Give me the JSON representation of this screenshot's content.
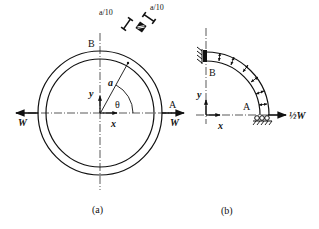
{
  "figure_a": {
    "caption": "(a)",
    "labels": {
      "B": "B",
      "A": "A",
      "radius": "a",
      "angle": "θ",
      "y_axis": "y",
      "x_axis": "x",
      "load_left": "W",
      "load_right": "W",
      "section_dim_1": "a/10",
      "section_dim_2": "a/10"
    }
  },
  "figure_b": {
    "caption": "(b)",
    "labels": {
      "B": "B",
      "A": "A",
      "y_axis": "y",
      "x_axis": "x",
      "load": "½W"
    }
  },
  "colors": {
    "ink": "#111111",
    "background": "#ffffff"
  }
}
